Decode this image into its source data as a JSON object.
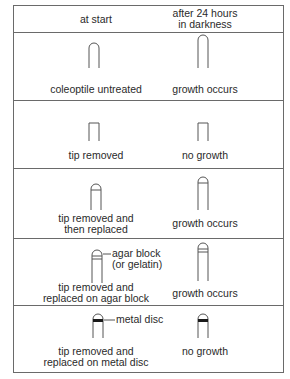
{
  "header": {
    "col_start": "at start",
    "col_after": "after 24 hours\nin darkness"
  },
  "rows": [
    {
      "start_label": "coleoptile untreated",
      "result_label": "growth occurs"
    },
    {
      "start_label": "tip removed",
      "result_label": "no growth"
    },
    {
      "start_label": "tip removed and\nthen replaced",
      "result_label": "growth occurs"
    },
    {
      "start_label": "tip removed and\nreplaced on agar block",
      "result_label": "growth occurs",
      "annotation": "agar block\n(or gelatin)"
    },
    {
      "start_label": "tip removed and\nreplaced on metal disc",
      "result_label": "no growth",
      "annotation": "metal disc"
    }
  ],
  "colors": {
    "line": "#6a6a6a",
    "ink": "#2a2a2a",
    "metal": "#1a1a1a"
  }
}
